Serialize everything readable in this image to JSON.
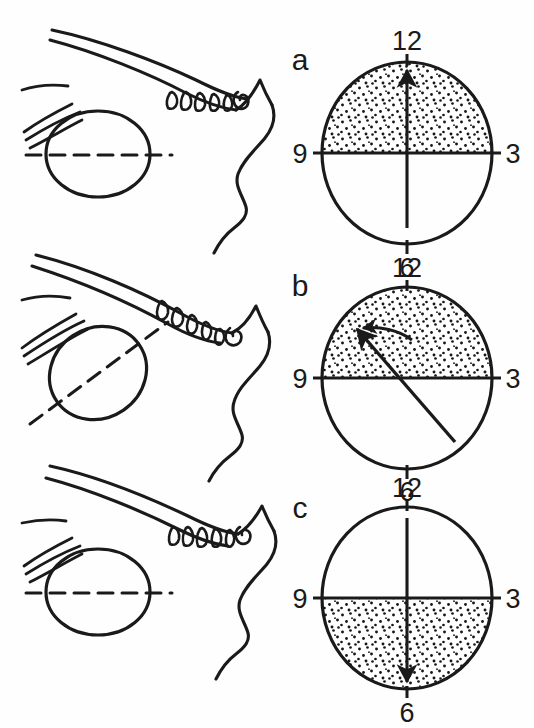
{
  "figure": {
    "type": "anatomical-clock-diagram",
    "background_color": "#fefefe",
    "ink_color": "#1a1a1a",
    "width": 534,
    "height": 728,
    "panel_count": 3
  },
  "panels": [
    {
      "id": "a",
      "letter": "a",
      "letter_x": 300,
      "letter_y": 70,
      "clock": {
        "cx": 407,
        "cy": 153,
        "rx": 85,
        "ry": 91,
        "stipple_half": "upper",
        "hours": [
          {
            "label": "12",
            "x": 407,
            "y": 50,
            "anchor": "middle"
          },
          {
            "label": "3",
            "x": 511,
            "y": 162,
            "anchor": "middle"
          },
          {
            "label": "6",
            "x": 407,
            "y": 268,
            "anchor": "middle"
          },
          {
            "label": "9",
            "x": 301,
            "y": 162,
            "anchor": "middle"
          }
        ],
        "axis_arrow": {
          "from_clock_hour": 6,
          "to_clock_hour": 12,
          "x1": 407,
          "y1": 228,
          "x2": 407,
          "y2": 68,
          "double_headed": false,
          "rotation_arc": false
        }
      },
      "anatomy": {
        "eye_shape": "lens-oval-upright",
        "eye_cx": 98,
        "eye_cy": 154,
        "eye_rx": 52,
        "eye_ry": 43,
        "dashed_axis_angle_deg": 0,
        "tooth_count": 5
      }
    },
    {
      "id": "b",
      "letter": "b",
      "letter_x": 300,
      "letter_y": 296,
      "clock": {
        "cx": 407,
        "cy": 378,
        "rx": 85,
        "ry": 91,
        "stipple_half": "upper",
        "hours": [
          {
            "label": "12",
            "x": 407,
            "y": 277,
            "anchor": "middle"
          },
          {
            "label": "3",
            "x": 511,
            "y": 387,
            "anchor": "middle"
          },
          {
            "label": "6",
            "x": 407,
            "y": 493,
            "anchor": "middle"
          },
          {
            "label": "9",
            "x": 301,
            "y": 387,
            "anchor": "middle"
          }
        ],
        "axis_arrow": {
          "from_clock_hour": 4.5,
          "to_clock_hour": 10.5,
          "x1": 448,
          "y1": 434,
          "x2": 355,
          "y2": 327,
          "double_headed": false,
          "rotation_arc": true,
          "arc_note": "curved arrow from near 12 o'clock sweeping counter-clockwise to the axis tip"
        }
      },
      "anatomy": {
        "eye_shape": "oval-tilted",
        "eye_cx": 98,
        "eye_cy": 373,
        "eye_rx": 50,
        "eye_ry": 45,
        "dashed_axis_angle_deg": -38,
        "tooth_count": 5
      }
    },
    {
      "id": "c",
      "letter": "c",
      "letter_x": 300,
      "letter_y": 518,
      "clock": {
        "cx": 407,
        "cy": 598,
        "rx": 85,
        "ry": 91,
        "stipple_half": "lower",
        "hours": [
          {
            "label": "12",
            "x": 407,
            "y": 497,
            "anchor": "middle"
          },
          {
            "label": "3",
            "x": 511,
            "y": 607,
            "anchor": "middle"
          },
          {
            "label": "6",
            "x": 407,
            "y": 713,
            "anchor": "middle"
          },
          {
            "label": "9",
            "x": 301,
            "y": 607,
            "anchor": "middle"
          }
        ],
        "axis_arrow": {
          "from_clock_hour": 12,
          "to_clock_hour": 6,
          "x1": 407,
          "y1": 518,
          "x2": 407,
          "y2": 684,
          "double_headed": false,
          "rotation_arc": false
        }
      },
      "anatomy": {
        "eye_shape": "lens-oval-upright",
        "eye_cx": 98,
        "eye_cy": 592,
        "eye_rx": 52,
        "eye_ry": 43,
        "dashed_axis_angle_deg": 0,
        "tooth_count": 5
      }
    }
  ]
}
